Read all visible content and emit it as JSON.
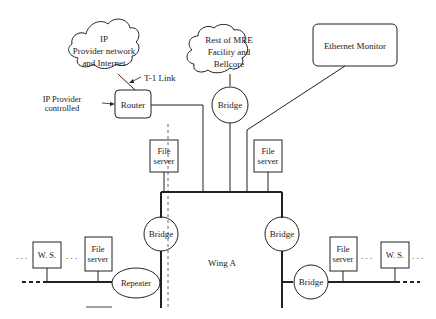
{
  "diagram": {
    "clouds": {
      "ip_provider": {
        "lines": [
          "IP",
          "Provider network",
          "and Internet"
        ]
      },
      "mre_facility": {
        "lines": [
          "Rest of MRE",
          "Facility and",
          "Bellcore"
        ]
      }
    },
    "boxes": {
      "ethernet_monitor": "Ethernet Monitor",
      "router": "Router",
      "file_server_center_left": [
        "File",
        "server"
      ],
      "file_server_center_right": [
        "File",
        "server"
      ],
      "file_server_left": [
        "File",
        "server"
      ],
      "file_server_right": [
        "File",
        "server"
      ],
      "ws_left": "W. S.",
      "ws_right": "W. S."
    },
    "circles": {
      "bridge_top": "Bridge",
      "bridge_left": "Bridge",
      "bridge_right": "Bridge",
      "bridge_lower_right": "Bridge",
      "repeater": "Repeater"
    },
    "annotations": {
      "t1_link": "T-1 Link",
      "ip_provider_controlled": [
        "IP Provider",
        "controlled"
      ],
      "wing_a": "Wing A",
      "ellipsis": ". . ."
    },
    "colors": {
      "line": "#222222",
      "background": "#ffffff"
    }
  }
}
